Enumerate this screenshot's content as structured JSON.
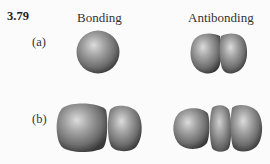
{
  "figure": {
    "problem_number": "3.79",
    "columns": {
      "bonding": "Bonding",
      "antibonding": "Antibonding"
    },
    "rows": [
      {
        "label": "(a)",
        "bonding": {
          "description": "single spherical lobe",
          "lobes": 1
        },
        "antibonding": {
          "description": "two lobes with a node between them",
          "lobes": 2
        }
      },
      {
        "label": "(b)",
        "bonding": {
          "description": "large lobe and smaller lobe",
          "lobes": 2
        },
        "antibonding": {
          "description": "three lobes with narrow middle lobe",
          "lobes": 3
        }
      }
    ],
    "colors": {
      "background": "#fbfbfb",
      "lobe_highlight": "#d8d8d8",
      "lobe_mid": "#8a8a8a",
      "lobe_shadow": "#3c3c3c"
    }
  }
}
